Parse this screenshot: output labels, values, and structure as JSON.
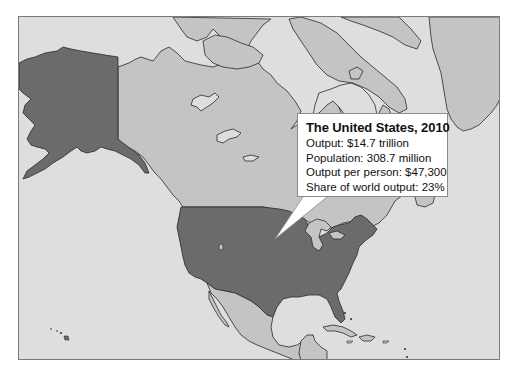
{
  "map": {
    "region": "North America",
    "highlighted_country": "United States",
    "colors": {
      "ocean": "#dedede",
      "land": "#c4c4c4",
      "highlight": "#6b6b6b",
      "coastline": "#2a2a2a",
      "frame": "#7a7a7a"
    }
  },
  "callout": {
    "title": "The United States, 2010",
    "lines": [
      "Output: $14.7 trillion",
      "Population: 308.7 million",
      "Output per person: $47,300",
      "Share of world output: 23%"
    ]
  }
}
